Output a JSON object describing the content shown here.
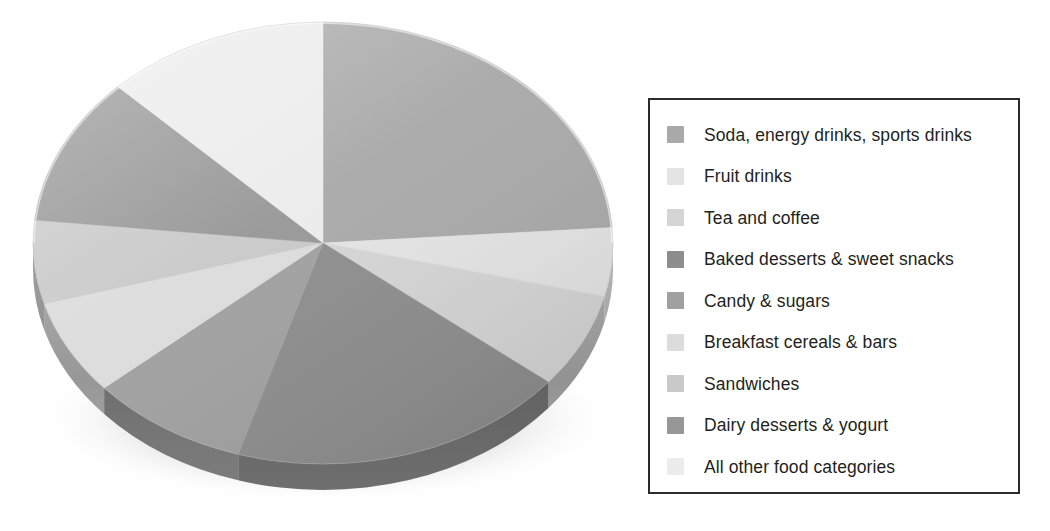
{
  "figure": {
    "kind": "3d-pie-chart",
    "background_color": "#ffffff"
  },
  "legend": {
    "border_color": "#2b2b2b",
    "background_color": "#ffffff",
    "text_color": "#231f20",
    "position": "right"
  },
  "chart_data": {
    "type": "pie",
    "title": "",
    "subtitle": "",
    "xlabel": "",
    "ylabel": "",
    "three_d": true,
    "start_angle_deg": 0,
    "direction": "clockwise",
    "legend_position": "right",
    "grid": false,
    "units": "percent",
    "categories": [
      "Soda, energy drinks, sports drinks",
      "Fruit drinks",
      "Tea and coffee",
      "Baked desserts & sweet snacks",
      "Candy & sugars",
      "Breakfast cereals & bars",
      "Sandwiches",
      "Dairy desserts & yogurt",
      "All other food categories"
    ],
    "values": [
      24,
      5,
      7,
      19,
      9,
      7,
      6,
      11,
      12
    ],
    "colors": [
      "#a9a9a9",
      "#e4e4e4",
      "#d5d5d5",
      "#8d8d8d",
      "#a0a0a0",
      "#dcdcdc",
      "#c9c9c9",
      "#979797",
      "#ececec"
    ],
    "slices": [
      {
        "label": "Soda, energy drinks, sports drinks",
        "value": 24,
        "color": "#a9a9a9",
        "start_deg": 0,
        "end_deg": 86
      },
      {
        "label": "Fruit drinks",
        "value": 5,
        "color": "#e4e4e4",
        "start_deg": 86,
        "end_deg": 104
      },
      {
        "label": "Tea and coffee",
        "value": 7,
        "color": "#d5d5d5",
        "start_deg": 104,
        "end_deg": 129
      },
      {
        "label": "Baked desserts & sweet snacks",
        "value": 19,
        "color": "#8d8d8d",
        "start_deg": 129,
        "end_deg": 197
      },
      {
        "label": "Candy & sugars",
        "value": 9,
        "color": "#a0a0a0",
        "start_deg": 197,
        "end_deg": 229
      },
      {
        "label": "Breakfast cereals & bars",
        "value": 7,
        "color": "#dcdcdc",
        "start_deg": 229,
        "end_deg": 254
      },
      {
        "label": "Sandwiches",
        "value": 6,
        "color": "#c9c9c9",
        "start_deg": 254,
        "end_deg": 276
      },
      {
        "label": "Dairy desserts & yogurt",
        "value": 11,
        "color": "#979797",
        "start_deg": 276,
        "end_deg": 315
      },
      {
        "label": "All other food categories",
        "value": 12,
        "color": "#ececec",
        "start_deg": 315,
        "end_deg": 360
      }
    ]
  }
}
